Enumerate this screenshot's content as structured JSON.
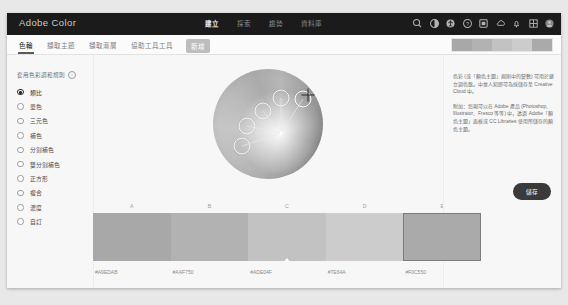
{
  "app": {
    "brand": "Adobe Color"
  },
  "topnav": {
    "items": [
      {
        "label": "建立",
        "active": true
      },
      {
        "label": "探索",
        "active": false
      },
      {
        "label": "趨勢",
        "active": false
      },
      {
        "label": "資料庫",
        "active": false
      }
    ],
    "icons": [
      "search-icon",
      "contrast-icon",
      "accessibility-icon",
      "help-icon",
      "apps-icon",
      "cloud-icon",
      "bell-icon",
      "grid-icon",
      "avatar-icon"
    ]
  },
  "tabs": [
    {
      "label": "色輪",
      "active": true,
      "pill": false
    },
    {
      "label": "擷取主題",
      "active": false,
      "pill": false
    },
    {
      "label": "擷取漸層",
      "active": false,
      "pill": false
    },
    {
      "label": "協助工具工具",
      "active": false,
      "pill": false
    },
    {
      "label": "新增",
      "active": false,
      "pill": true
    }
  ],
  "sidebar": {
    "title": "套用色彩調和規則",
    "info_icon": "i",
    "rules": [
      {
        "label": "類比",
        "selected": true
      },
      {
        "label": "單色",
        "selected": false
      },
      {
        "label": "三元色",
        "selected": false
      },
      {
        "label": "補色",
        "selected": false
      },
      {
        "label": "分割補色",
        "selected": false
      },
      {
        "label": "雙分割補色",
        "selected": false
      },
      {
        "label": "正方形",
        "selected": false
      },
      {
        "label": "複合",
        "selected": false
      },
      {
        "label": "濃度",
        "selected": false
      },
      {
        "label": "自訂",
        "selected": false
      }
    ]
  },
  "wheel": {
    "name": "color-wheel",
    "markers": [
      {
        "id": "A",
        "left": "26%",
        "top": "70%",
        "primary": false
      },
      {
        "id": "B",
        "left": "31%",
        "top": "52%",
        "primary": false
      },
      {
        "id": "C",
        "left": "45%",
        "top": "38%",
        "primary": false
      },
      {
        "id": "D",
        "left": "62%",
        "top": "26%",
        "primary": true
      },
      {
        "id": "E",
        "left": "82%",
        "top": "27%",
        "primary": false
      }
    ],
    "crosshair": {
      "left": "86%",
      "top": "24%"
    }
  },
  "palette": {
    "labels": [
      "A",
      "B",
      "C",
      "D",
      "E"
    ],
    "active_index": 4,
    "marker_index": 2,
    "swatches": [
      {
        "label": "A",
        "hex": "#A9EDAB",
        "display": "#a8a8a8"
      },
      {
        "label": "B",
        "hex": "#AAF750",
        "display": "#b2b2b2"
      },
      {
        "label": "C",
        "hex": "#ADE04F",
        "display": "#c2c2c2"
      },
      {
        "label": "D",
        "hex": "#7E64A",
        "display": "#cccccc"
      },
      {
        "label": "E",
        "hex": "#F0C550",
        "display": "#aaaaaa"
      }
    ]
  },
  "rightpanel": {
    "paragraph1": "色彩 (或「顏色主題」規則中的變數) 可用於建立調色盤。中並人知即可為採儲存至 Creative Cloud 中。",
    "paragraph2": "附加：您現可以在 Adobe 產品 (Photoshop、Illustrator、Fresco 等等) 中，透過 Adobe「顏色主題」面板或 CC Libraries 使用所儲存的顏色主題。",
    "save_label": "儲存"
  }
}
